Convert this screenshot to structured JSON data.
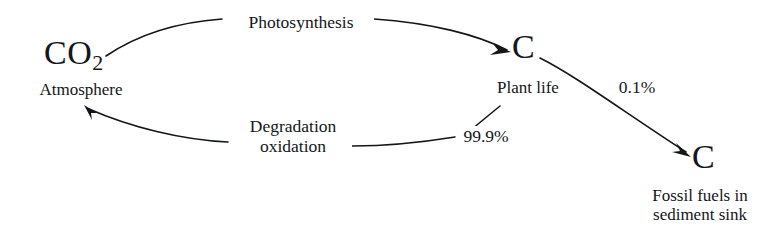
{
  "diagram": {
    "ink_color": "#14161a",
    "background_color": "#ffffff",
    "nodes": [
      {
        "id": "atmosphere",
        "symbol": "CO",
        "subscript": "2",
        "caption": "Atmosphere"
      },
      {
        "id": "plant-life",
        "symbol": "C",
        "caption": "Plant life"
      },
      {
        "id": "fossil-fuels",
        "symbol": "C",
        "caption_line1": "Fossil fuels in",
        "caption_line2": "sediment sink"
      }
    ],
    "edges": [
      {
        "id": "photosynthesis",
        "label": "Photosynthesis",
        "from": "atmosphere",
        "to": "plant-life"
      },
      {
        "id": "degradation",
        "label_line1": "Degradation",
        "label_line2": "oxidation",
        "from": "plant-life",
        "to": "atmosphere"
      },
      {
        "id": "degradation-share",
        "label": "99.9%",
        "from": "plant-life",
        "to": "atmosphere"
      },
      {
        "id": "burial",
        "label": "0.1%",
        "from": "plant-life",
        "to": "fossil-fuels"
      }
    ]
  }
}
